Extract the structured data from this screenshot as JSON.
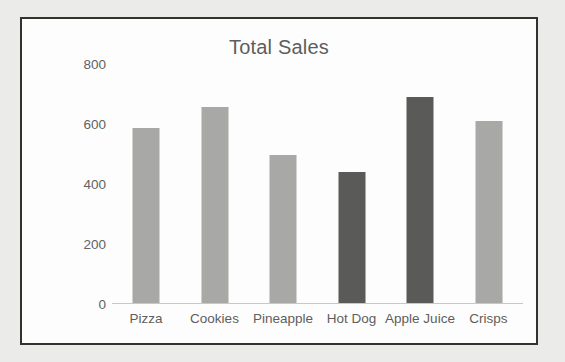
{
  "chart_data": {
    "type": "bar",
    "title": "Total Sales",
    "xlabel": "",
    "ylabel": "",
    "categories": [
      "Pizza",
      "Cookies",
      "Pineapple",
      "Hot Dog",
      "Apple Juice",
      "Crisps"
    ],
    "values": [
      587,
      657,
      495,
      440,
      690,
      609
    ],
    "bar_colors": [
      "#a8a8a6",
      "#a8a8a6",
      "#a8a8a6",
      "#5a5a58",
      "#5a5a58",
      "#a8a8a6"
    ],
    "yticks": [
      0,
      200,
      400,
      600,
      800
    ],
    "ytick_labels": [
      "0",
      "200",
      "400",
      "600",
      "800"
    ],
    "ylim": [
      0,
      800
    ],
    "grid": false,
    "legend": null,
    "legend_position": "none",
    "series": [
      {
        "name": "Total Sales",
        "values": [
          587,
          657,
          495,
          440,
          690,
          609
        ]
      }
    ]
  },
  "style": {
    "page_background": "#ebebea",
    "plot_background": "#fdfdfd",
    "frame_border_color": "#33322f",
    "title_color": "#5e5d5b",
    "tick_label_color": "#636260",
    "axis_line_color": "#c9c8c6",
    "bar_light": "#a8a8a6",
    "bar_dark": "#5a5a58"
  }
}
